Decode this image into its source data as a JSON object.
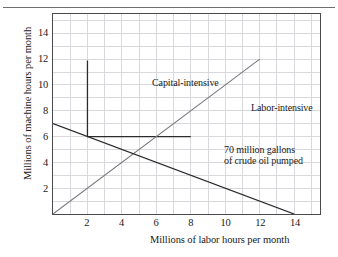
{
  "chart_data": {
    "type": "line",
    "title": "",
    "xlabel": "Millions of labor hours per month",
    "ylabel": "Millions of machine hours per month",
    "xlim": [
      0,
      15.5
    ],
    "ylim": [
      0,
      15.5
    ],
    "xticks": [
      2,
      4,
      6,
      8,
      10,
      12,
      14
    ],
    "yticks": [
      2,
      4,
      6,
      8,
      10,
      12,
      14
    ],
    "grid": true,
    "grid_step": 1,
    "legend": "none",
    "series": [
      {
        "name": "Capital-intensive",
        "kind": "isoquant-corner",
        "color": "#2b2b2b",
        "points": [
          [
            2,
            11.9
          ],
          [
            2,
            6
          ],
          [
            8,
            6
          ]
        ]
      },
      {
        "name": "Labor-intensive",
        "kind": "ray",
        "color": "#7a7a7e",
        "points": [
          [
            0,
            0
          ],
          [
            12,
            12
          ]
        ]
      },
      {
        "name": "Isocost",
        "kind": "line",
        "color": "#2b2b2b",
        "points": [
          [
            0,
            7
          ],
          [
            14,
            0
          ]
        ]
      }
    ],
    "annotations": [
      {
        "name": "capital-intensive-label",
        "text": "Capital-intensive",
        "x": 3.6,
        "y": 11.6
      },
      {
        "name": "labor-intensive-label",
        "text": "Labor-intensive",
        "x": 9.0,
        "y": 9.7
      },
      {
        "name": "crude-oil-label-line1",
        "text": "70 million gallons",
        "x": 8.2,
        "y": 6.5
      },
      {
        "name": "crude-oil-label-line2",
        "text": "of crude oil pumped",
        "x": 8.2,
        "y": 5.6
      }
    ]
  },
  "axes": {
    "x_title": "Millions of labor hours per month",
    "y_title": "Millions of machine hours per month",
    "x_tick_labels": [
      "2",
      "4",
      "6",
      "8",
      "10",
      "12",
      "14"
    ],
    "y_tick_labels": [
      "2",
      "4",
      "6",
      "8",
      "10",
      "12",
      "14"
    ]
  },
  "labels": {
    "capital_intensive": "Capital-intensive",
    "labor_intensive": "Labor-intensive",
    "crude_oil_line1": "70 million gallons",
    "crude_oil_line2": "of crude oil pumped"
  },
  "colors": {
    "frame": "#4a4a4e",
    "grid": "#d9d9dd",
    "isoquant": "#2b2b2b",
    "ray": "#7a7a7e",
    "isocost": "#2b2b2b",
    "rule": "#6e6e72",
    "text": "#1a1a1a"
  }
}
